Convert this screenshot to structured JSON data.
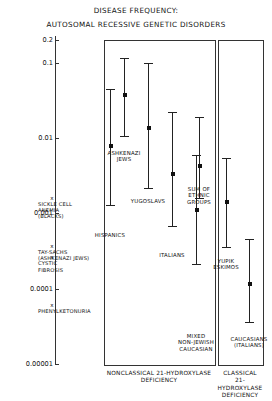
{
  "title": {
    "line1": "DISEASE FREQUENCY:",
    "line2": "AUTOSOMAL RECESSIVE GENETIC DISORDERS"
  },
  "chart_data": {
    "type": "scatter",
    "title": "DISEASE FREQUENCY: AUTOSOMAL RECESSIVE GENETIC DISORDERS",
    "xlabel": "",
    "ylabel": "",
    "yscale": "log",
    "ylim": [
      1e-05,
      0.2
    ],
    "grid": false,
    "legend": "none",
    "ytick_labels": [
      "0.2",
      "0.1",
      "0.01",
      "0.001",
      "0.0001",
      "0.00001"
    ],
    "ytick_values": [
      0.2,
      0.1,
      0.01,
      0.001,
      0.0001,
      1e-05
    ],
    "groups": [
      {
        "name": "NONCLASSICAL 21-HYDROXYLASE DEFICIENCY",
        "caption_line1": "NONCLASSICAL 21-HYDROXYLASE",
        "caption_line2": "DEFICIENCY",
        "points": [
          {
            "label_line1": "ASHKENAZI",
            "label_line2": "JEWS",
            "value": 0.037,
            "low": 0.0105,
            "high": 0.115
          },
          {
            "label_line1": "YUGOSLAVS",
            "label_line2": "",
            "value": 0.0135,
            "low": 0.0022,
            "high": 0.098
          },
          {
            "label_line1": "HISPANICS",
            "label_line2": "",
            "value": 0.0078,
            "low": 0.0013,
            "high": 0.045
          },
          {
            "label_line1": "ITALIANS",
            "label_line2": "",
            "value": 0.0033,
            "low": 0.00068,
            "high": 0.022
          },
          {
            "label_line1": "SUM OF",
            "label_line2": "ETHNIC",
            "label_line3": "GROUPS",
            "value": 0.0043,
            "low": 0.0016,
            "high": 0.019
          },
          {
            "label_line1": "MIXED",
            "label_line2": "NON-JEWISH",
            "label_line3": "CAUCASIAN",
            "value": 0.0011,
            "low": 0.00021,
            "high": 0.006
          }
        ]
      },
      {
        "name": "CLASSICAL 21-HYDROXYLASE DEFICIENCY",
        "caption_line1": "CLASSICAL",
        "caption_line2": "21-HYDROXYLASE",
        "caption_line3": "DEFICIENCY",
        "points": [
          {
            "label_line1": "YUPIK",
            "label_line2": "ESKIMOS",
            "value": 0.0014,
            "low": 0.00036,
            "high": 0.0055
          },
          {
            "label_line1": "CAUCASIANS",
            "label_line2": "(ITALIANS)",
            "value": 0.000115,
            "low": 3.6e-05,
            "high": 0.00046
          }
        ]
      }
    ],
    "reference_markers": [
      {
        "label_line1": "SICKLE CELL",
        "label_line2": "ANEMIA",
        "label_line3": "(BLACKS)",
        "value": 0.0016,
        "marker": "x"
      },
      {
        "label_line1": "TAY-SACHS",
        "label_line2": "(ASHKENAZI JEWS)",
        "label_line3": "",
        "value": 0.00037,
        "marker": "x"
      },
      {
        "label_line1": "CYSTIC",
        "label_line2": "FIBROSIS",
        "label_line3": "",
        "value": 0.00026,
        "marker": "x"
      },
      {
        "label_line1": "PHENYLKETONURIA",
        "label_line2": "",
        "label_line3": "",
        "value": 6e-05,
        "marker": "x"
      }
    ]
  }
}
